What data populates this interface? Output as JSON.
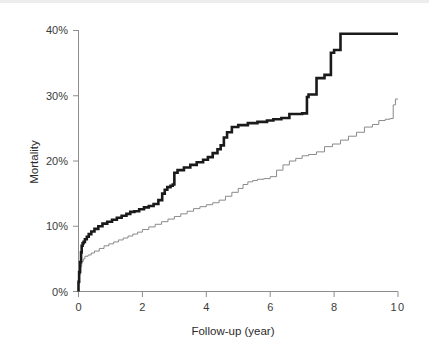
{
  "figure": {
    "background_color": "#ffffff",
    "plot_type": "step-line-kaplan-meier"
  },
  "axes": {
    "x": {
      "label": "Follow-up (year)",
      "ticks": [
        "0",
        "2",
        "4",
        "6",
        "8",
        "10"
      ],
      "tick_values": [
        0,
        2,
        4,
        6,
        8,
        10
      ],
      "min": 0,
      "max": 10
    },
    "y": {
      "label": "Mortality",
      "ticks": [
        "0%",
        "10%",
        "20%",
        "30%",
        "40%"
      ],
      "tick_values": [
        0,
        10,
        20,
        30,
        40
      ],
      "min": 0,
      "max": 40
    }
  },
  "colors": {
    "bold_series": "#1a1a1a",
    "thin_series": "#8a8a8a",
    "axis": "#8d8d8d",
    "text": "#2b2b2b"
  },
  "chart_data": {
    "type": "line",
    "title": "",
    "subtitle": "",
    "xlabel": "Follow-up (year)",
    "ylabel": "Mortality",
    "xlim": [
      0,
      10
    ],
    "ylim": [
      0,
      40
    ],
    "grid": false,
    "legend": null,
    "legend_position": "none",
    "annotations": [],
    "xticks": [
      0,
      2,
      4,
      6,
      8,
      10
    ],
    "xticklabels": [
      "0",
      "2",
      "4",
      "6",
      "8",
      "10"
    ],
    "yticks": [
      0,
      10,
      20,
      30,
      40
    ],
    "yticklabels": [
      "0%",
      "10%",
      "20%",
      "30%",
      "40%"
    ],
    "series": [
      {
        "name": "bold-curve",
        "style": "step",
        "linewidth": "thick",
        "color": "#1a1a1a",
        "x": [
          0.0,
          0.02,
          0.05,
          0.08,
          0.1,
          0.13,
          0.16,
          0.2,
          0.26,
          0.32,
          0.4,
          0.5,
          0.62,
          0.75,
          0.9,
          1.05,
          1.2,
          1.35,
          1.5,
          1.62,
          1.75,
          1.9,
          2.05,
          2.2,
          2.35,
          2.5,
          2.62,
          2.7,
          2.78,
          2.88,
          2.95,
          3.0,
          3.1,
          3.3,
          3.5,
          3.7,
          3.9,
          4.05,
          4.2,
          4.35,
          4.45,
          4.55,
          4.65,
          4.8,
          5.0,
          5.3,
          5.6,
          5.9,
          6.1,
          6.35,
          6.6,
          7.0,
          7.15,
          7.2,
          7.45,
          7.7,
          7.9,
          8.0,
          8.2,
          8.3,
          9.0,
          10.0
        ],
        "y": [
          0.0,
          1.5,
          3.0,
          4.5,
          6.0,
          7.0,
          7.4,
          7.6,
          8.0,
          8.4,
          8.8,
          9.2,
          9.6,
          10.0,
          10.4,
          10.7,
          11.0,
          11.3,
          11.6,
          11.9,
          12.2,
          12.3,
          12.6,
          12.9,
          13.1,
          13.4,
          14.0,
          15.0,
          15.6,
          16.0,
          16.2,
          16.4,
          18.2,
          18.6,
          19.0,
          19.4,
          19.8,
          20.2,
          20.6,
          21.2,
          21.8,
          22.4,
          23.6,
          24.4,
          25.2,
          25.5,
          25.8,
          26.0,
          26.2,
          26.4,
          26.6,
          27.2,
          27.3,
          29.8,
          30.2,
          32.7,
          33.2,
          36.6,
          37.0,
          39.5,
          39.5,
          39.5
        ],
        "final_value": 39.5
      },
      {
        "name": "thin-curve",
        "style": "step",
        "linewidth": "thin",
        "color": "#8a8a8a",
        "x": [
          0.0,
          0.03,
          0.06,
          0.1,
          0.15,
          0.2,
          0.3,
          0.4,
          0.5,
          0.65,
          0.8,
          0.95,
          1.1,
          1.25,
          1.4,
          1.55,
          1.7,
          1.85,
          2.0,
          2.2,
          2.4,
          2.6,
          2.8,
          3.0,
          3.2,
          3.4,
          3.6,
          3.8,
          4.0,
          4.2,
          4.4,
          4.6,
          4.8,
          5.0,
          5.15,
          5.3,
          5.45,
          5.6,
          5.8,
          6.0,
          6.2,
          6.4,
          6.6,
          6.8,
          7.0,
          7.2,
          7.45,
          7.7,
          7.95,
          8.2,
          8.45,
          8.7,
          8.95,
          9.2,
          9.4,
          9.6,
          9.75,
          9.85,
          9.92,
          10.0
        ],
        "y": [
          0.0,
          1.2,
          2.6,
          3.8,
          4.6,
          5.0,
          5.4,
          5.6,
          5.9,
          6.2,
          6.6,
          7.0,
          7.3,
          7.6,
          7.9,
          8.2,
          8.5,
          8.8,
          9.1,
          9.5,
          9.9,
          10.3,
          10.7,
          11.1,
          11.5,
          11.9,
          12.3,
          12.7,
          13.0,
          13.3,
          13.6,
          14.0,
          14.6,
          15.2,
          15.8,
          16.4,
          16.8,
          17.0,
          17.2,
          17.3,
          17.6,
          18.6,
          19.4,
          20.0,
          20.4,
          20.8,
          21.0,
          21.4,
          22.2,
          22.6,
          23.2,
          23.8,
          24.4,
          25.2,
          25.6,
          26.2,
          26.4,
          26.5,
          28.6,
          29.5
        ],
        "final_value": 29.5
      }
    ]
  }
}
